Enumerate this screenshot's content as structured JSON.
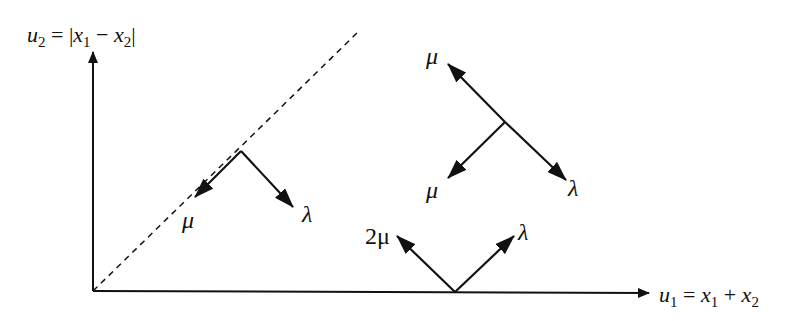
{
  "diagram": {
    "y_axis_label": {
      "var": "u",
      "sub": "2",
      "eq": " = |",
      "x1": "x",
      "x1sub": "1",
      "minus": " − ",
      "x2": "x",
      "x2sub": "2",
      "close": "|"
    },
    "x_axis_label": {
      "var": "u",
      "sub": "1",
      "eq": " = ",
      "x1": "x",
      "x1sub": "1",
      "plus": " + ",
      "x2": "x",
      "x2sub": "2"
    },
    "diagonal_node": {
      "left_label": "μ",
      "right_label": "λ"
    },
    "interior_node": {
      "up_label": "μ",
      "down_left_label": "μ",
      "down_right_label": "λ"
    },
    "boundary_node": {
      "left_label": "2μ",
      "right_label": "λ"
    }
  }
}
